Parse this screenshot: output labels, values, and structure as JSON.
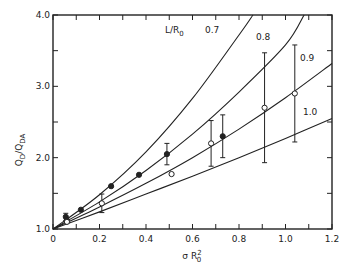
{
  "chart_data": {
    "type": "scatter",
    "title": "",
    "xlabel": "σ R0²",
    "ylabel": "QD/QDA",
    "xlim": [
      0,
      1.2
    ],
    "ylim": [
      1.0,
      4.0
    ],
    "x_ticks": [
      "0",
      "0.2",
      "0.4",
      "0.6",
      "0.8",
      "1.0",
      "1.2"
    ],
    "y_ticks": [
      "1.0",
      "2.0",
      "3.0",
      "4.0"
    ],
    "grid": false,
    "legend_title": "L/R0",
    "curves": [
      {
        "name": "0.7",
        "points": [
          [
            0,
            1.0
          ],
          [
            0.2,
            1.48
          ],
          [
            0.4,
            2.08
          ],
          [
            0.6,
            2.83
          ],
          [
            0.8,
            3.72
          ],
          [
            0.86,
            4.0
          ]
        ]
      },
      {
        "name": "0.8",
        "points": [
          [
            0,
            1.0
          ],
          [
            0.2,
            1.38
          ],
          [
            0.4,
            1.82
          ],
          [
            0.6,
            2.33
          ],
          [
            0.8,
            2.92
          ],
          [
            1.0,
            3.58
          ],
          [
            1.08,
            4.0
          ]
        ]
      },
      {
        "name": "0.9",
        "points": [
          [
            0,
            1.0
          ],
          [
            0.2,
            1.31
          ],
          [
            0.4,
            1.64
          ],
          [
            0.6,
            2.0
          ],
          [
            0.8,
            2.4
          ],
          [
            1.0,
            2.84
          ],
          [
            1.2,
            3.32
          ]
        ]
      },
      {
        "name": "1.0",
        "points": [
          [
            0,
            1.0
          ],
          [
            0.2,
            1.24
          ],
          [
            0.4,
            1.49
          ],
          [
            0.6,
            1.74
          ],
          [
            0.8,
            2.0
          ],
          [
            1.0,
            2.27
          ],
          [
            1.2,
            2.55
          ]
        ]
      }
    ],
    "series": [
      {
        "name": "filled",
        "marker": "filled-circle",
        "points": [
          {
            "x": 0.055,
            "y": 1.17,
            "err": 0.05
          },
          {
            "x": 0.06,
            "y": 1.12
          },
          {
            "x": 0.12,
            "y": 1.27
          },
          {
            "x": 0.25,
            "y": 1.6
          },
          {
            "x": 0.37,
            "y": 1.76
          },
          {
            "x": 0.49,
            "y": 2.05,
            "err": 0.15
          },
          {
            "x": 0.73,
            "y": 2.3,
            "err": 0.3
          }
        ]
      },
      {
        "name": "open",
        "marker": "open-circle",
        "points": [
          {
            "x": 0.06,
            "y": 1.1
          },
          {
            "x": 0.21,
            "y": 1.36,
            "err": 0.13
          },
          {
            "x": 0.51,
            "y": 1.77
          },
          {
            "x": 0.68,
            "y": 2.2,
            "err": 0.32
          },
          {
            "x": 0.91,
            "y": 2.7,
            "err": 0.77
          },
          {
            "x": 1.04,
            "y": 2.9,
            "err": 0.68
          }
        ]
      }
    ]
  }
}
